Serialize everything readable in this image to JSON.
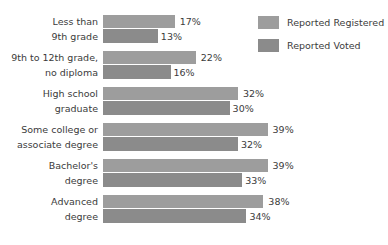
{
  "legend": {
    "position": "top-right",
    "items": [
      {
        "label": "Reported Registered",
        "color": "#9d9d9d",
        "swatch_name": "legend-swatch-registered"
      },
      {
        "label": "Reported Voted",
        "color": "#8b8b8b",
        "swatch_name": "legend-swatch-voted"
      }
    ]
  },
  "chart_data": {
    "type": "bar",
    "orientation": "horizontal",
    "grouped": true,
    "title": "",
    "subtitle": "",
    "xlabel": "",
    "ylabel": "",
    "grid": false,
    "legend_position": "top-right",
    "axis_visible": false,
    "value_suffix": "%",
    "xlim": [
      0,
      39
    ],
    "categories": [
      "Less than 9th grade",
      "9th to 12th grade, no diploma",
      "High school graduate",
      "Some college or associate degree",
      "Bachelor's degree",
      "Advanced degree"
    ],
    "category_lines": [
      [
        "Less than",
        "9th grade"
      ],
      [
        "9th to 12th grade,",
        "no diploma"
      ],
      [
        "High school",
        "graduate"
      ],
      [
        "Some college or",
        "associate degree"
      ],
      [
        "Bachelor's",
        "degree"
      ],
      [
        "Advanced",
        "degree"
      ]
    ],
    "series": [
      {
        "name": "Reported Registered",
        "color": "#9d9d9d",
        "values": [
          17,
          22,
          32,
          39,
          39,
          38
        ],
        "labels": [
          "17%",
          "22%",
          "32%",
          "39%",
          "39%",
          "38%"
        ]
      },
      {
        "name": "Reported Voted",
        "color": "#8b8b8b",
        "values": [
          13,
          16,
          30,
          32,
          33,
          34
        ],
        "labels": [
          "13%",
          "16%",
          "30%",
          "32%",
          "33%",
          "34%"
        ]
      }
    ]
  },
  "render": {
    "px_per_percent": 4.22,
    "bar_origin_x": 103
  }
}
